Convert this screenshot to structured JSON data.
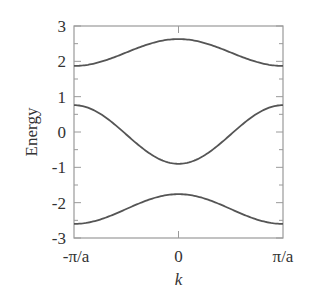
{
  "chart_data": {
    "type": "line",
    "title": "",
    "xlabel": "k",
    "ylabel": "Energy",
    "xlim": [
      -3.14159,
      3.14159
    ],
    "ylim": [
      -3,
      3
    ],
    "x_ticks": [
      {
        "value": -3.14159,
        "label": "-π/a"
      },
      {
        "value": 0,
        "label": "0"
      },
      {
        "value": 3.14159,
        "label": "π/a"
      }
    ],
    "y_ticks": [
      {
        "value": 3,
        "label": "3"
      },
      {
        "value": 2,
        "label": "2"
      },
      {
        "value": 1,
        "label": "1"
      },
      {
        "value": 0,
        "label": "0"
      },
      {
        "value": -1,
        "label": "-1"
      },
      {
        "value": -2,
        "label": "-2"
      },
      {
        "value": -3,
        "label": "-3"
      }
    ],
    "y_minor_step": 0.5,
    "grid": false,
    "legend": null,
    "series": [
      {
        "name": "upper band",
        "model": "E = 2.25 + 0.38 cos(ka)",
        "x": [
          "-π/a",
          "-π/2a",
          "0",
          "π/2a",
          "π/a"
        ],
        "values": [
          1.87,
          2.25,
          2.63,
          2.25,
          1.87
        ]
      },
      {
        "name": "middle band",
        "model": "E = -0.07 - 0.83 cos(ka)",
        "x": [
          "-π/a",
          "-π/2a",
          "0",
          "π/2a",
          "π/a"
        ],
        "values": [
          0.76,
          -0.07,
          -0.9,
          -0.07,
          0.76
        ]
      },
      {
        "name": "lower band",
        "model": "E = -2.18 + 0.42 cos(ka)",
        "x": [
          "-π/a",
          "-π/2a",
          "0",
          "π/2a",
          "π/a"
        ],
        "values": [
          -2.6,
          -2.18,
          -1.76,
          -2.18,
          -2.6
        ]
      }
    ],
    "band_params": [
      {
        "c": 2.25,
        "A": 0.38
      },
      {
        "c": -0.07,
        "A": -0.83
      },
      {
        "c": -2.18,
        "A": 0.42
      }
    ]
  },
  "labels": {
    "xlabel": "k",
    "ylabel": "Energy",
    "x_left": "-π/a",
    "x_mid": "0",
    "x_right": "π/a",
    "y": [
      "3",
      "2",
      "1",
      "0",
      "-1",
      "-2",
      "-3"
    ]
  },
  "colors": {
    "curve": "#555555",
    "axis": "#9a9a9a",
    "text": "#333333"
  }
}
